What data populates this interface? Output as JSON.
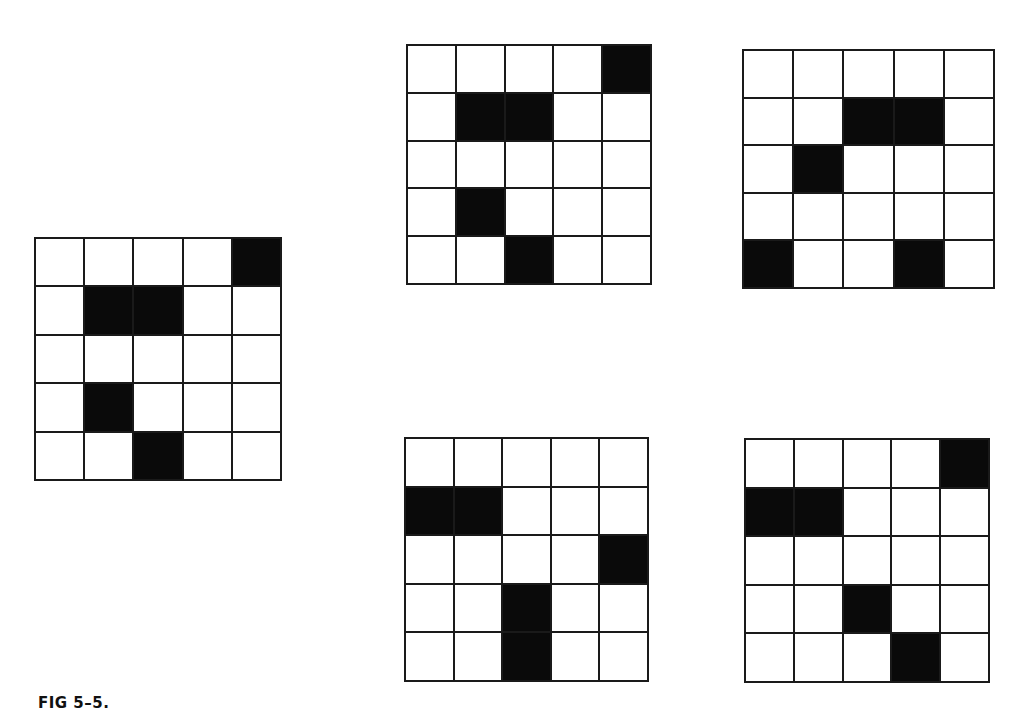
{
  "figure": {
    "caption": "FIG 5–5.",
    "grid_size": {
      "rows": 5,
      "cols": 5
    },
    "colors": {
      "filled": "#0a0a0a",
      "empty": "#ffffff",
      "line": "#1a1a1a"
    },
    "grids": [
      {
        "id": "reference",
        "position": "left",
        "box": {
          "left": 34,
          "top": 237,
          "width": 248,
          "height": 244
        },
        "filled_cells": [
          [
            0,
            4
          ],
          [
            1,
            1
          ],
          [
            1,
            2
          ],
          [
            3,
            1
          ],
          [
            4,
            2
          ]
        ]
      },
      {
        "id": "option-top-middle",
        "position": "top-middle",
        "box": {
          "left": 406,
          "top": 44,
          "width": 246,
          "height": 241
        },
        "filled_cells": [
          [
            0,
            4
          ],
          [
            1,
            1
          ],
          [
            1,
            2
          ],
          [
            3,
            1
          ],
          [
            4,
            2
          ]
        ]
      },
      {
        "id": "option-top-right",
        "position": "top-right",
        "box": {
          "left": 742,
          "top": 49,
          "width": 253,
          "height": 240
        },
        "filled_cells": [
          [
            1,
            2
          ],
          [
            1,
            3
          ],
          [
            2,
            1
          ],
          [
            4,
            0
          ],
          [
            4,
            3
          ]
        ]
      },
      {
        "id": "option-bottom-middle",
        "position": "bottom-middle",
        "box": {
          "left": 404,
          "top": 437,
          "width": 245,
          "height": 245
        },
        "filled_cells": [
          [
            1,
            0
          ],
          [
            1,
            1
          ],
          [
            2,
            4
          ],
          [
            3,
            2
          ],
          [
            4,
            2
          ]
        ]
      },
      {
        "id": "option-bottom-right",
        "position": "bottom-right",
        "box": {
          "left": 744,
          "top": 438,
          "width": 246,
          "height": 245
        },
        "filled_cells": [
          [
            0,
            4
          ],
          [
            1,
            0
          ],
          [
            1,
            1
          ],
          [
            3,
            2
          ],
          [
            4,
            3
          ]
        ]
      }
    ]
  }
}
